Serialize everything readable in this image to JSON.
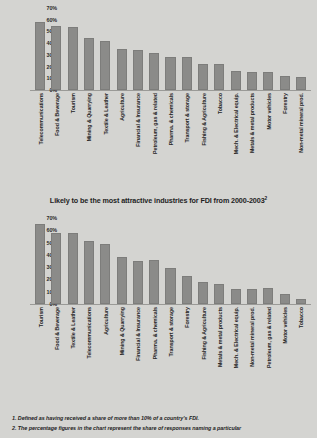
{
  "caption": {
    "text": "Likely to be the most attractive industries for FDI from 2000-2003",
    "superscript": "2"
  },
  "footnotes": [
    "1. Defined as having received a share of more than 10% of a country's FDI.",
    "2. The percentage figures in the chart represent the share of responses naming a particular"
  ],
  "colors": {
    "background": "#d4d4d1",
    "bar": "#8b8b89",
    "axis": "#9a9a97",
    "text": "#252525"
  },
  "chart_data": [
    {
      "id": "top",
      "type": "bar",
      "title": "",
      "xlabel": "",
      "ylabel": "",
      "ylim": [
        0,
        70
      ],
      "grid": false,
      "legend": false,
      "tick_labels": [
        "70%",
        "60%",
        "50%",
        "40%",
        "30%",
        "20%",
        "10%",
        "0%"
      ],
      "categories": [
        "Telecommunications",
        "Food  & Beverage",
        "Tourism",
        "Mining & Quarrying",
        "Textile & Leather",
        "Agriculture",
        "Financial & Insurance",
        "Petroleum, gas & related",
        "Pharma. & chemicals",
        "Transport & storage",
        "Fishing & Agriculture",
        "Tobacco",
        "Mech. & Electrical equip.",
        "Metals & metal products",
        "Motor vehicles",
        "Forestry",
        "Non-metal mineral prod."
      ],
      "values": [
        58,
        55,
        54,
        44,
        42,
        35,
        34,
        32,
        28,
        28,
        22,
        22,
        16,
        15,
        15,
        12,
        11
      ]
    },
    {
      "id": "bottom",
      "type": "bar",
      "title": "",
      "xlabel": "",
      "ylabel": "",
      "ylim": [
        0,
        70
      ],
      "grid": false,
      "legend": false,
      "tick_labels": [
        "70%",
        "60%",
        "50%",
        "40%",
        "30%",
        "20%",
        "10%",
        "0%"
      ],
      "categories": [
        "Tourism",
        "Food  & Beverage",
        "Textile & Leather",
        "Telecommunications",
        "Agriculture",
        "Mining & Quarrying",
        "Financial & Insurance",
        "Pharma. & chemicals",
        "Transport & storage",
        "Forestry",
        "Fishing & Agriculture",
        "Metals & metal products",
        "Mech. & Electrical equip.",
        "Non-metal mineral prod.",
        "Petroleum, gas & related",
        "Motor vehicles",
        "Tobacco"
      ],
      "values": [
        65,
        58,
        58,
        51,
        49,
        38,
        35,
        36,
        29,
        23,
        18,
        16,
        12,
        12,
        13,
        8,
        4
      ]
    }
  ]
}
